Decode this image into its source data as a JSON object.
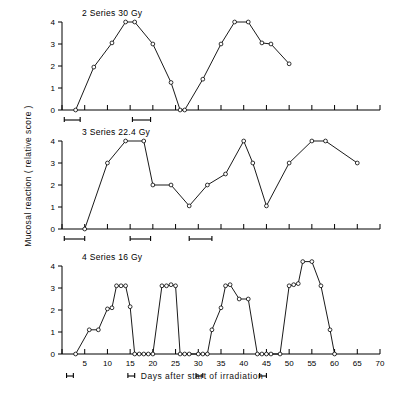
{
  "figure": {
    "y_axis_label": "Mucosal reaction ( relative score )",
    "x_axis_label": "Days after start of irradiation"
  },
  "chart_data": {
    "type": "line",
    "title": "",
    "xlabel": "Days after start of irradiation",
    "ylabel": "Mucosal reaction ( relative score )",
    "xlim": [
      0,
      70
    ],
    "ylim": [
      0,
      4
    ],
    "xticks": [
      0,
      5,
      10,
      15,
      20,
      25,
      30,
      35,
      40,
      45,
      50,
      55,
      60,
      65,
      70
    ],
    "xtick_labels": [
      "",
      "5",
      "10",
      "15",
      "20",
      "25",
      "30",
      "35",
      "40",
      "45",
      "50",
      "55",
      "60",
      "65",
      "70"
    ],
    "yticks": [
      0,
      1,
      2,
      3,
      4
    ],
    "ytick_labels": [
      "0",
      "1",
      "2",
      "3",
      "4"
    ],
    "grid": false,
    "legend": "none",
    "marker": "open-circle",
    "panels": [
      {
        "id": "panel-30gy",
        "label": "2 Series 30 Gy",
        "series_number": "2",
        "dose": "30 Gy",
        "x": [
          3,
          7,
          11,
          14,
          16,
          20,
          24,
          26,
          27,
          31,
          35,
          38,
          41,
          44,
          48
        ],
        "y": [
          0,
          1.95,
          3.05,
          4,
          4,
          3,
          1.25,
          0,
          0,
          1.4,
          3,
          4,
          4,
          3.05,
          3
        ],
        "points": [
          {
            "x": 3,
            "y": 0
          },
          {
            "x": 7,
            "y": 1.95
          },
          {
            "x": 11,
            "y": 3.05
          },
          {
            "x": 14,
            "y": 4
          },
          {
            "x": 16,
            "y": 4
          },
          {
            "x": 20,
            "y": 3
          },
          {
            "x": 24,
            "y": 1.25
          },
          {
            "x": 26,
            "y": 0
          },
          {
            "x": 27,
            "y": 0
          },
          {
            "x": 31,
            "y": 1.4
          },
          {
            "x": 35,
            "y": 3
          },
          {
            "x": 38,
            "y": 4
          },
          {
            "x": 41,
            "y": 4
          },
          {
            "x": 44,
            "y": 3.05
          },
          {
            "x": 46,
            "y": 3
          },
          {
            "x": 50,
            "y": 2.1
          }
        ],
        "treatment_bars": [
          [
            0.5,
            4.0
          ],
          [
            15.5,
            19.5
          ]
        ]
      },
      {
        "id": "panel-22-4gy",
        "label": "3 Series 22.4 Gy",
        "series_number": "3",
        "dose": "22.4 Gy",
        "points": [
          {
            "x": 5,
            "y": 0
          },
          {
            "x": 10,
            "y": 3
          },
          {
            "x": 14,
            "y": 4
          },
          {
            "x": 18,
            "y": 4
          },
          {
            "x": 20,
            "y": 2
          },
          {
            "x": 24,
            "y": 2
          },
          {
            "x": 28,
            "y": 1.05
          },
          {
            "x": 32,
            "y": 2
          },
          {
            "x": 36,
            "y": 2.5
          },
          {
            "x": 40,
            "y": 4
          },
          {
            "x": 42,
            "y": 3
          },
          {
            "x": 45,
            "y": 1.05
          },
          {
            "x": 50,
            "y": 3
          },
          {
            "x": 55,
            "y": 4
          },
          {
            "x": 58,
            "y": 4
          },
          {
            "x": 65,
            "y": 3
          }
        ],
        "treatment_bars": [
          [
            0.5,
            5.0
          ],
          [
            15.0,
            19.5
          ],
          [
            28.0,
            33.0
          ]
        ]
      },
      {
        "id": "panel-16gy",
        "label": "4 Series 16 Gy",
        "series_number": "4",
        "dose": "16 Gy",
        "points": [
          {
            "x": 3,
            "y": 0
          },
          {
            "x": 6,
            "y": 1.1
          },
          {
            "x": 8,
            "y": 1.1
          },
          {
            "x": 10,
            "y": 2.05
          },
          {
            "x": 11,
            "y": 2.1
          },
          {
            "x": 12,
            "y": 3.1
          },
          {
            "x": 13,
            "y": 3.1
          },
          {
            "x": 14,
            "y": 3.1
          },
          {
            "x": 15,
            "y": 2.15
          },
          {
            "x": 16,
            "y": 0
          },
          {
            "x": 17,
            "y": 0
          },
          {
            "x": 18,
            "y": 0
          },
          {
            "x": 19,
            "y": 0
          },
          {
            "x": 20,
            "y": 0
          },
          {
            "x": 22,
            "y": 3.1
          },
          {
            "x": 23,
            "y": 3.1
          },
          {
            "x": 24,
            "y": 3.15
          },
          {
            "x": 25,
            "y": 3.1
          },
          {
            "x": 26,
            "y": 0
          },
          {
            "x": 27,
            "y": 0
          },
          {
            "x": 28,
            "y": 0
          },
          {
            "x": 30,
            "y": 0
          },
          {
            "x": 31,
            "y": 0
          },
          {
            "x": 32,
            "y": 0
          },
          {
            "x": 33,
            "y": 1.1
          },
          {
            "x": 35,
            "y": 2.1
          },
          {
            "x": 36,
            "y": 3.1
          },
          {
            "x": 37,
            "y": 3.15
          },
          {
            "x": 39,
            "y": 2.5
          },
          {
            "x": 41,
            "y": 2.5
          },
          {
            "x": 43,
            "y": 0
          },
          {
            "x": 44,
            "y": 0
          },
          {
            "x": 45,
            "y": 0
          },
          {
            "x": 46,
            "y": 0
          },
          {
            "x": 48,
            "y": 0
          },
          {
            "x": 50,
            "y": 3.1
          },
          {
            "x": 51,
            "y": 3.15
          },
          {
            "x": 52,
            "y": 3.2
          },
          {
            "x": 53,
            "y": 4.2
          },
          {
            "x": 55,
            "y": 4.2
          },
          {
            "x": 57,
            "y": 3.1
          },
          {
            "x": 59,
            "y": 1.1
          },
          {
            "x": 60,
            "y": 0
          }
        ],
        "treatment_bars": [
          [
            1.0,
            2.5
          ],
          [
            14.5,
            16.0
          ],
          [
            29.5,
            31.0
          ],
          [
            43.5,
            45.0
          ]
        ]
      }
    ]
  }
}
